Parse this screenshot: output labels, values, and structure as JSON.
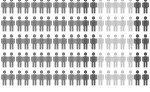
{
  "chart_data": {
    "type": "pictogram",
    "title": "",
    "rows": 5,
    "columns": 20,
    "unit": "person icon",
    "legend": [],
    "categories": [
      "group-a",
      "group-b",
      "group-c",
      "group-d"
    ],
    "colors": {
      "group-a": "#7d7d7d",
      "group-b": "#5e5e5e",
      "group-c": "#c4c4c4",
      "group-d": "#555555"
    },
    "per_row_pattern": [
      "group-a",
      "group-a",
      "group-a",
      "group-a",
      "group-a",
      "group-a",
      "group-a",
      "group-a",
      "group-a",
      "group-a",
      "group-a",
      "group-b",
      "group-b",
      "group-c",
      "group-c",
      "group-c",
      "group-c",
      "group-c",
      "group-d",
      "group-d"
    ],
    "values": [
      55,
      10,
      25,
      10
    ],
    "counts_per_row": {
      "group-a": 11,
      "group-b": 2,
      "group-c": 5,
      "group-d": 2
    }
  }
}
